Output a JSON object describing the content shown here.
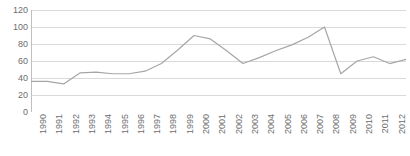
{
  "watermark": {
    "text": ""
  },
  "chart_data": {
    "type": "line",
    "title": "",
    "subtitle": "",
    "xlabel": "",
    "ylabel": "",
    "categories": [
      "1990",
      "1991",
      "1992",
      "1993",
      "1994",
      "1995",
      "1996",
      "1997",
      "1998",
      "1999",
      "2000",
      "2001",
      "2002",
      "2003",
      "2004",
      "2005",
      "2006",
      "2007",
      "2008",
      "2009",
      "2010",
      "2011",
      "2012",
      "2013"
    ],
    "values": [
      36,
      36,
      33,
      46,
      47,
      45,
      45,
      48,
      57,
      73,
      90,
      86,
      72,
      57,
      64,
      72,
      79,
      88,
      100,
      45,
      60,
      65,
      57,
      62
    ],
    "series": [
      {
        "name": "series-1",
        "values": [
          36,
          36,
          33,
          46,
          47,
          45,
          45,
          48,
          57,
          73,
          90,
          86,
          72,
          57,
          64,
          72,
          79,
          88,
          100,
          45,
          60,
          65,
          57,
          62
        ],
        "color": "#a6a6a6"
      }
    ],
    "ylim": [
      0,
      120
    ],
    "yticks": [
      0,
      20,
      40,
      60,
      80,
      100,
      120
    ],
    "ytick_labels": [
      "0",
      "20",
      "40",
      "60",
      "80",
      "100",
      "120"
    ],
    "grid": true,
    "grid_axis": "y",
    "grid_color": "#d9d9d9",
    "axis_color": "#bfbfbf",
    "legend": false,
    "legend_position": "none",
    "markers": false,
    "annotations": []
  }
}
